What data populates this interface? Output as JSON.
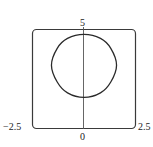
{
  "chart_data": {
    "type": "line",
    "title": "",
    "xlabel": "",
    "ylabel": "",
    "xlim": [
      -2.5,
      2.5
    ],
    "ylim": [
      0,
      5
    ],
    "grid": false,
    "legend": null,
    "tick_labels": {
      "x_left": "−2.5",
      "x_right": "2.5",
      "y_bottom": "0",
      "y_top": "5"
    },
    "series": [
      {
        "name": "closed curve",
        "color": "#2a2a2a",
        "points": [
          {
            "x": 0.0,
            "y": 4.75
          },
          {
            "x": 0.8,
            "y": 4.55
          },
          {
            "x": 1.3,
            "y": 4.05
          },
          {
            "x": 1.58,
            "y": 3.2
          },
          {
            "x": 1.3,
            "y": 2.35
          },
          {
            "x": 0.8,
            "y": 1.8
          },
          {
            "x": 0.0,
            "y": 1.57
          },
          {
            "x": -0.8,
            "y": 1.8
          },
          {
            "x": -1.3,
            "y": 2.35
          },
          {
            "x": -1.58,
            "y": 3.2
          },
          {
            "x": -1.3,
            "y": 4.05
          },
          {
            "x": -0.8,
            "y": 4.55
          },
          {
            "x": 0.0,
            "y": 4.75
          }
        ]
      }
    ]
  },
  "axes": {
    "frame_color": "#3a3a3a",
    "axis_color": "#555555"
  }
}
